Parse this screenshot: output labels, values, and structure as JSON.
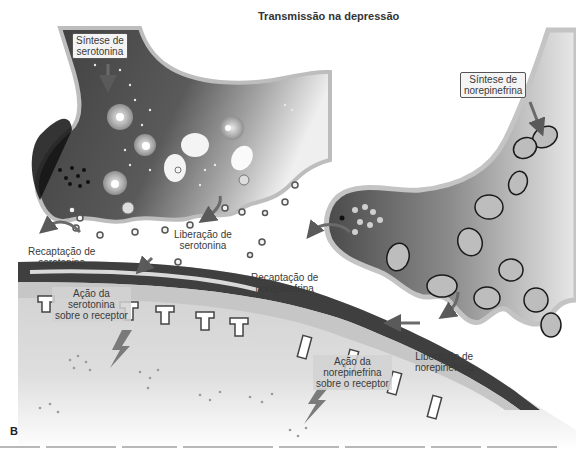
{
  "figure": {
    "title": "Transmissão na depressão",
    "panel_letter": "B",
    "labels": {
      "serotonin_synthesis": {
        "line1": "Síntese de",
        "line2": "serotonina"
      },
      "serotonin_release": {
        "line1": "Liberação de",
        "line2": "serotonina"
      },
      "serotonin_reuptake": {
        "line1": "Recaptação de",
        "line2": "serotonina"
      },
      "serotonin_action": {
        "line1": "Ação da",
        "line2": "serotonina",
        "line3": "sobre o receptor"
      },
      "norepinephrine_synthesis": {
        "line1": "Síntese de",
        "line2": "norepinefrina"
      },
      "norepinephrine_reuptake": {
        "line1": "Recaptação de",
        "line2": "norepinefrina"
      },
      "norepinephrine_release": {
        "line1": "Liberação de",
        "line2": "norepinefrina"
      },
      "norepinephrine_action": {
        "line1": "Ação da",
        "line2": "norepinefrina",
        "line3": "sobre o receptor"
      }
    },
    "colors": {
      "neuron_dark": "#4a4a4a",
      "neuron_mid": "#8a8a8a",
      "membrane_light": "#c8c8c8",
      "postsynaptic_band": "#3f3f3f",
      "postsynaptic_fill": "#d6d6d6",
      "arrow": "#6a6a6a"
    }
  }
}
